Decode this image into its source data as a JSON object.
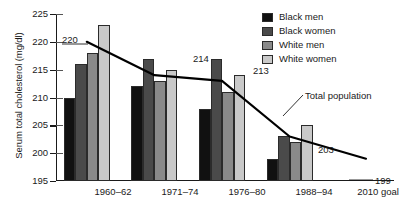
{
  "chart_data": {
    "type": "bar",
    "title": "",
    "xlabel": "",
    "ylabel": "Serum total cholesterol (mg/dl)",
    "ylim": [
      195,
      225
    ],
    "ytick_step": 5,
    "yticks": [
      195,
      200,
      205,
      210,
      215,
      220,
      225
    ],
    "grid": false,
    "legend_position": "top-right",
    "categories": [
      "1960–62",
      "1971–74",
      "1976–80",
      "1988–94",
      "2010 goal"
    ],
    "series": [
      {
        "name": "Black men",
        "color": "#111111",
        "values": [
          210,
          212,
          208,
          199,
          null
        ]
      },
      {
        "name": "Black women",
        "color": "#4a4a4a",
        "values": [
          216,
          217,
          217,
          203,
          null
        ]
      },
      {
        "name": "White men",
        "color": "#8a8a8a",
        "values": [
          218,
          213,
          211,
          202,
          null
        ]
      },
      {
        "name": "White women",
        "color": "#c9c9c9",
        "values": [
          223,
          215,
          214,
          205,
          null
        ]
      }
    ],
    "overlay_line": {
      "name": "Total population",
      "color": "#000000",
      "x": [
        "1960–62",
        "1971–74",
        "1976–80",
        "1988–94",
        "2010 goal"
      ],
      "values": [
        220,
        214,
        213,
        203,
        199
      ],
      "point_labels": [
        "220",
        "214",
        "213",
        "203",
        "199"
      ]
    },
    "annotations": [
      {
        "text": "Total population",
        "target": "overlay_line"
      }
    ]
  },
  "legend": {
    "items": [
      {
        "label": "Black men",
        "color": "#111111"
      },
      {
        "label": "Black women",
        "color": "#4a4a4a"
      },
      {
        "label": "White men",
        "color": "#8a8a8a"
      },
      {
        "label": "White women",
        "color": "#c9c9c9"
      }
    ]
  },
  "axis": {
    "y_title": "Serum total cholesterol (mg/dl)",
    "y_labels": [
      "225",
      "220",
      "215",
      "210",
      "205",
      "200",
      "195"
    ],
    "x_labels": [
      "1960–62",
      "1971–74",
      "1976–80",
      "1988–94",
      "2010 goal"
    ]
  },
  "value_labels": {
    "v220": "220",
    "v214": "214",
    "v213": "213",
    "v203": "203",
    "v199": "199"
  },
  "annotation": {
    "total_population": "Total population"
  }
}
